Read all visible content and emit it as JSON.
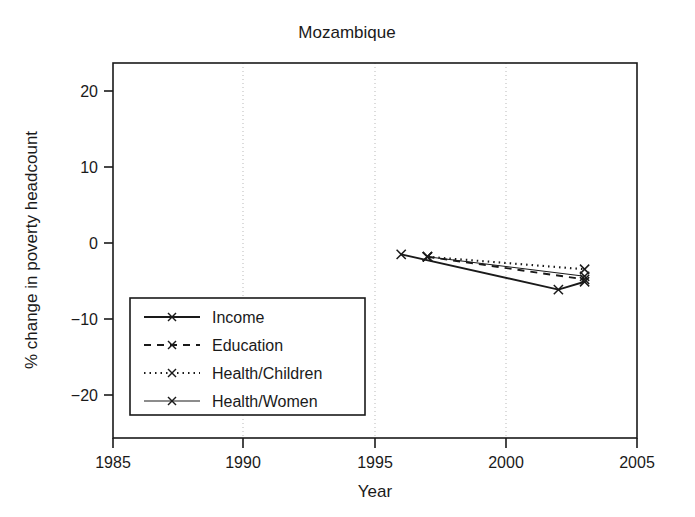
{
  "chart_data": {
    "type": "line",
    "title": "Mozambique",
    "xlabel": "Year",
    "ylabel": "% change in poverty headcount",
    "xlim": [
      1985,
      2005
    ],
    "ylim": [
      -24,
      24
    ],
    "xticks": [
      1985,
      1990,
      1995,
      2000,
      2005
    ],
    "xtick_labels": [
      "1985",
      "1990",
      "1995",
      "2000",
      "2005"
    ],
    "yticks": [
      20,
      10,
      0,
      -10,
      -20
    ],
    "ytick_labels": [
      "20",
      "10",
      "0",
      "−10",
      "−20"
    ],
    "grid": "vertical-dotted-at-1990-1995-2000",
    "legend_position": "lower-left-inside",
    "series": [
      {
        "name": "Income",
        "style": "solid",
        "marker": "x",
        "x": [
          1996,
          2002,
          2003
        ],
        "y": [
          -0.5,
          -5.0,
          -4.0
        ]
      },
      {
        "name": "Education",
        "style": "dashed",
        "marker": "x",
        "x": [
          1997,
          2003
        ],
        "y": [
          -0.8,
          -3.7
        ]
      },
      {
        "name": "Health/Children",
        "style": "dotted",
        "marker": "x",
        "x": [
          1997,
          2003
        ],
        "y": [
          -0.8,
          -2.4
        ]
      },
      {
        "name": "Health/Women",
        "style": "solid-thin",
        "marker": "x",
        "x": [
          1997,
          2003
        ],
        "y": [
          -0.8,
          -3.3
        ]
      }
    ]
  },
  "colors": {
    "foreground": "#1a1a1a",
    "background": "#ffffff",
    "gridline": "#b9b9b9"
  },
  "legend": {
    "entries": [
      {
        "label": "Income"
      },
      {
        "label": "Education"
      },
      {
        "label": "Health/Children"
      },
      {
        "label": "Health/Women"
      }
    ]
  },
  "axis": {
    "x_tick_labels": [
      "1985",
      "1990",
      "1995",
      "2000",
      "2005"
    ],
    "y_tick_labels": [
      "20",
      "10",
      "0",
      "−10",
      "−20"
    ],
    "x_title": "Year",
    "y_title": "% change in poverty headcount"
  },
  "title": "Mozambique"
}
